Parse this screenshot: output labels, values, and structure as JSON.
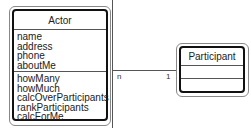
{
  "actor": {
    "name": "Actor",
    "attributes": [
      "name",
      "address",
      "phone",
      "aboutMe"
    ],
    "methods": [
      "howMany",
      "howMuch",
      "calcOverParticipants",
      "rankParticipants",
      "calcForMe"
    ]
  },
  "participant": {
    "name": "Participant",
    "attributes": [],
    "methods": []
  },
  "association": {
    "actor_multiplicity": "n",
    "participant_multiplicity": "1"
  }
}
